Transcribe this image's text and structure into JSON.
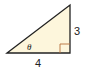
{
  "diagram": {
    "type": "right-triangle",
    "labels": {
      "opposite_side": "3",
      "adjacent_side": "4",
      "angle": "θ"
    },
    "colors": {
      "fill": "#fdf6dc",
      "stroke": "#222222",
      "right_angle_marker": "#b5703a"
    }
  }
}
